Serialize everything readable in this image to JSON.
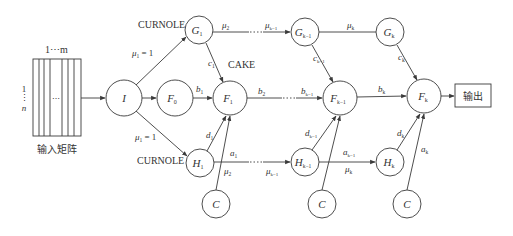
{
  "diagram": {
    "input_matrix": {
      "label": "输入矩阵",
      "columns_label": "1⋯m",
      "rows_label_top": "1",
      "rows_label_dots": "⋮",
      "rows_label_bottom": "n",
      "inner_dots": "⋯"
    },
    "nodes": {
      "input": {
        "label": "I"
      },
      "F0": {
        "base": "F",
        "sub": "0"
      },
      "G1": {
        "base": "G",
        "sub": "1"
      },
      "F1": {
        "base": "F",
        "sub": "1"
      },
      "H1": {
        "base": "H",
        "sub": "1"
      },
      "C1": {
        "base": "C",
        "sub": ""
      },
      "Gk1": {
        "base": "G",
        "sub": "k−1"
      },
      "Fk1": {
        "base": "F",
        "sub": "k−1"
      },
      "Hk1": {
        "base": "H",
        "sub": "k−1"
      },
      "C2": {
        "base": "C",
        "sub": ""
      },
      "Gk": {
        "base": "G",
        "sub": "k"
      },
      "Fk": {
        "base": "F",
        "sub": "k"
      },
      "Hk": {
        "base": "H",
        "sub": "k"
      },
      "C3": {
        "base": "C",
        "sub": ""
      }
    },
    "annotations": {
      "curnole_top": "CURNOLE",
      "curnole_bottom": "CURNOLE",
      "cake": "CAKE"
    },
    "edge_labels": {
      "mu1_top": {
        "base": "μ",
        "sub": "1",
        "suffix": " = 1"
      },
      "mu1_bottom": {
        "base": "μ",
        "sub": "1",
        "suffix": " = 1"
      },
      "b1": {
        "base": "b",
        "sub": "1"
      },
      "c1": {
        "base": "c",
        "sub": "1"
      },
      "d1": {
        "base": "d",
        "sub": "1"
      },
      "a1": {
        "base": "a",
        "sub": "1"
      },
      "mu2_top": {
        "base": "μ",
        "sub": "2"
      },
      "mu2_bottom": {
        "base": "μ",
        "sub": "2"
      },
      "muk1_top": {
        "base": "μ",
        "sub": "k−1"
      },
      "muk1_bottom": {
        "base": "μ",
        "sub": "k−1"
      },
      "b2": {
        "base": "b",
        "sub": "2"
      },
      "bk1": {
        "base": "b",
        "sub": "k−1"
      },
      "ck1": {
        "base": "c",
        "sub": "k−1"
      },
      "dk1": {
        "base": "d",
        "sub": "k−1"
      },
      "ak1": {
        "base": "a",
        "sub": "k−1"
      },
      "muk_top": {
        "base": "μ",
        "sub": "k"
      },
      "muk_bottom": {
        "base": "μ",
        "sub": "k"
      },
      "bk": {
        "base": "b",
        "sub": "k"
      },
      "ck": {
        "base": "c",
        "sub": "k"
      },
      "dk": {
        "base": "d",
        "sub": "k"
      },
      "ak": {
        "base": "a",
        "sub": "k"
      }
    },
    "output_box": {
      "label": "输出"
    },
    "colors": {
      "stroke": "#3a3a3a",
      "text": "#333333",
      "background": "#ffffff"
    }
  }
}
